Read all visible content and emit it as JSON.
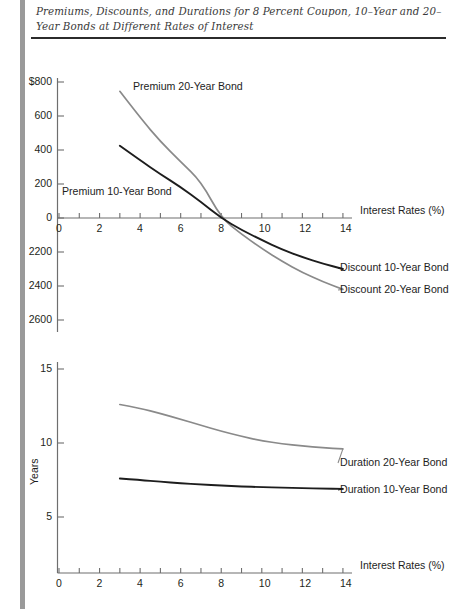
{
  "figure": {
    "title": "Premiums, Discounts, and Durations for 8 Percent Coupon, 10–Year and 20–Year Bonds at Different Rates of Interest"
  },
  "colors": {
    "curve_10_year": "#1d1d1d",
    "curve_20_year": "#8a8a8a",
    "axis": "#6e6e6e",
    "left_rule": "#9a9a9a",
    "title_rule": "#2b2b2b"
  },
  "chart_data": [
    {
      "type": "line",
      "title": "Premiums and Discounts",
      "xlabel": "Interest Rates (%)",
      "ylabel": "",
      "xlim": [
        0,
        14.6
      ],
      "ylim": [
        -650,
        800
      ],
      "grid": false,
      "legend_position": "inline-annotations",
      "xticks": [
        0,
        1,
        2,
        3,
        4,
        5,
        6,
        7,
        8,
        9,
        10,
        11,
        12,
        13,
        14
      ],
      "xticklabels": [
        "0",
        "",
        "2",
        "",
        "4",
        "",
        "6",
        "",
        "8",
        "",
        "10",
        "",
        "12",
        "",
        "14"
      ],
      "yticks": [
        800,
        600,
        400,
        200,
        0,
        -200,
        -400,
        -600
      ],
      "yticklabels": [
        "$800",
        "600",
        "400",
        "200",
        "0",
        "2200",
        "2400",
        "2600"
      ],
      "annotations": [
        {
          "text": "Premium 20-Year Bond",
          "x": 3.6,
          "y": 735
        },
        {
          "text": "Premium 10-Year Bond",
          "x": 0.6,
          "y": 150
        },
        {
          "text": "Discount 10-Year Bond",
          "x": 14.4,
          "y": -300
        },
        {
          "text": "Discount 20-Year Bond",
          "x": 14.4,
          "y": -420
        }
      ],
      "series": [
        {
          "name": "Premium 20-Year Bond",
          "color": "#8a8a8a",
          "x": [
            3,
            4,
            5,
            6,
            7,
            8,
            9,
            10,
            11,
            12,
            13,
            14
          ],
          "y": [
            745,
            590,
            450,
            330,
            215,
            0,
            -95,
            -180,
            -255,
            -320,
            -375,
            -420
          ]
        },
        {
          "name": "Premium 10-Year Bond",
          "color": "#1d1d1d",
          "x": [
            3,
            4,
            5,
            6,
            7,
            8,
            9,
            10,
            11,
            12,
            13,
            14
          ],
          "y": [
            425,
            340,
            258,
            182,
            95,
            0,
            -70,
            -130,
            -185,
            -230,
            -268,
            -300
          ]
        }
      ]
    },
    {
      "type": "line",
      "title": "Durations",
      "xlabel": "Interest Rates (%)",
      "ylabel": "Years",
      "xlim": [
        0,
        14.6
      ],
      "ylim": [
        3.2,
        16
      ],
      "grid": false,
      "legend_position": "inline-annotations",
      "xticks": [
        0,
        1,
        2,
        3,
        4,
        5,
        6,
        7,
        8,
        9,
        10,
        11,
        12,
        13,
        14
      ],
      "xticklabels": [
        "0",
        "",
        "2",
        "",
        "4",
        "",
        "6",
        "",
        "8",
        "",
        "10",
        "",
        "12",
        "",
        "14"
      ],
      "yticks": [
        15,
        10,
        5
      ],
      "yticklabels": [
        "15",
        "10",
        "5"
      ],
      "annotations": [
        {
          "text": "Duration 20-Year Bond",
          "x": 14.4,
          "y": 9.55
        },
        {
          "text": "Duration 10-Year Bond",
          "x": 14.4,
          "y": 6.9
        }
      ],
      "series": [
        {
          "name": "Duration 20-Year Bond",
          "color": "#8a8a8a",
          "x": [
            3,
            4,
            5,
            6,
            7,
            8,
            9,
            10,
            11,
            12,
            13,
            14
          ],
          "y": [
            12.6,
            12.35,
            12.0,
            11.6,
            11.2,
            10.8,
            10.45,
            10.15,
            9.95,
            9.8,
            9.68,
            9.6
          ]
        },
        {
          "name": "Duration 10-Year Bond",
          "color": "#1d1d1d",
          "x": [
            3,
            4,
            5,
            6,
            7,
            8,
            9,
            10,
            11,
            12,
            13,
            14
          ],
          "y": [
            7.6,
            7.5,
            7.38,
            7.28,
            7.2,
            7.12,
            7.06,
            7.02,
            6.98,
            6.95,
            6.92,
            6.9
          ]
        }
      ]
    }
  ]
}
